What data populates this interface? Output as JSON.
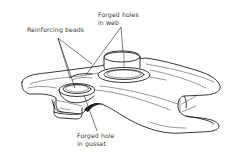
{
  "diagram": {
    "labels": {
      "reinforcing_beads": "Reinforcing beads",
      "forged_holes_web_line1": "Forged holes",
      "forged_holes_web_line2": "in web",
      "forged_hole_gusset_line1": "Forged hole",
      "forged_hole_gusset_line2": "in gusset"
    },
    "colors": {
      "line": "#222222",
      "text": "#3a3a3a",
      "background": "#ffffff"
    }
  }
}
